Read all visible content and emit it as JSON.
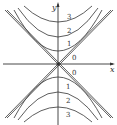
{
  "figure": {
    "type": "contour-map",
    "axes": {
      "x_label": "x",
      "y_label": "y"
    },
    "level_labels_upper": [
      "3",
      "2",
      "1",
      "0"
    ],
    "level_labels_lower": [
      "0",
      "1",
      "2",
      "3"
    ],
    "colors": {
      "curve": "#333333",
      "axis": "#333333",
      "background": "#ffffff"
    }
  }
}
